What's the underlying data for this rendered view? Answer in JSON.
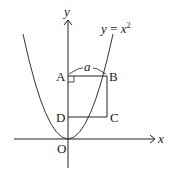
{
  "diagram": {
    "curve_label": {
      "y": "y",
      "eq": " = ",
      "x": "x",
      "exp": "2"
    },
    "axes": {
      "x_label": "x",
      "y_label": "y",
      "origin_label": "O"
    },
    "points": {
      "A": "A",
      "B": "B",
      "C": "C",
      "D": "D"
    },
    "segment_label": "a",
    "colors": {
      "stroke": "#222222",
      "background": "#ffffff"
    }
  }
}
